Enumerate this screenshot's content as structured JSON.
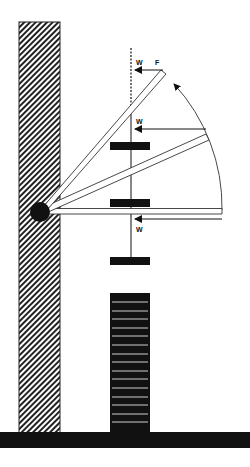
{
  "diagram": {
    "title": "",
    "colors": {
      "ink": "#111111",
      "background": "#ffffff",
      "hatch": "#222222"
    },
    "labels": {
      "weight_top": "W",
      "force_top": "F",
      "weight_middle": "W",
      "weight_bottom": "W"
    },
    "components": [
      {
        "id": "wall",
        "description": "hatched vertical wall on left"
      },
      {
        "id": "ground",
        "description": "black horizontal floor bar"
      },
      {
        "id": "weight-stack",
        "description": "stack of plates standing on floor"
      },
      {
        "id": "pivot",
        "description": "black circular hinge on wall"
      },
      {
        "id": "arm-horizontal",
        "description": "arm at horizontal position"
      },
      {
        "id": "arm-middle",
        "description": "arm raised ~30 degrees"
      },
      {
        "id": "arm-top",
        "description": "arm raised ~55 degrees"
      },
      {
        "id": "rotation-arc",
        "description": "arc with arrow showing upward rotation"
      },
      {
        "id": "plumb-line",
        "description": "vertical line with three weight plates"
      }
    ],
    "stack_plate_count": 15
  }
}
